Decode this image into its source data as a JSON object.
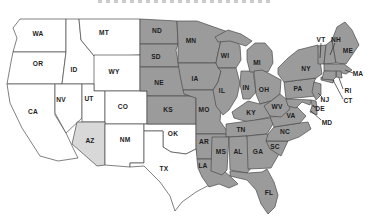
{
  "map": {
    "colors": {
      "shaded": "#9b9b9b",
      "highlight": "#d8d8d8",
      "unshaded": "#ffffff",
      "border": "#4a4a4a",
      "label": "#1d1d1d",
      "leader": "#2a2a2a"
    },
    "states": [
      {
        "abbr": "WA",
        "shade": "unshaded",
        "label_x": 38,
        "label_y": 34,
        "path": "M20,19 L66,19 L66,52 L13,52 L17,38 L13,28 Z"
      },
      {
        "abbr": "OR",
        "shade": "unshaded",
        "label_x": 38,
        "label_y": 64,
        "path": "M13,52 L66,52 L62,84 L7,84 L11,62 Z"
      },
      {
        "abbr": "CA",
        "shade": "unshaded",
        "label_x": 33,
        "label_y": 112,
        "path": "M7,84 L55,84 L55,115 L66,133 L74,150 L78,158 L58,161 L40,156 L22,128 L10,103 Z"
      },
      {
        "abbr": "ID",
        "shade": "unshaded",
        "label_x": 74,
        "label_y": 70,
        "path": "M66,19 L79,19 L81,40 L95,57 L95,84 L62,84 L66,52 Z"
      },
      {
        "abbr": "MT",
        "shade": "unshaded",
        "label_x": 104,
        "label_y": 33,
        "path": "M79,19 L140,19 L140,55 L95,57 L81,40 Z"
      },
      {
        "abbr": "WY",
        "shade": "unshaded",
        "label_x": 114,
        "label_y": 72,
        "path": "M94,55 L140,55 L140,91 L94,91 Z"
      },
      {
        "abbr": "NV",
        "shade": "unshaded",
        "label_x": 61,
        "label_y": 100,
        "path": "M55,84 L82,84 L82,118 L66,133 L55,113 Z"
      },
      {
        "abbr": "UT",
        "shade": "unshaded",
        "label_x": 89,
        "label_y": 99,
        "path": "M82,84 L94,84 L94,91 L105,91 L105,122 L82,122 Z"
      },
      {
        "abbr": "CO",
        "shade": "unshaded",
        "label_x": 123,
        "label_y": 107,
        "path": "M105,91 L147,91 L147,124 L105,124 Z"
      },
      {
        "abbr": "AZ",
        "shade": "highlight",
        "label_x": 90,
        "label_y": 141,
        "path": "M77,122 L105,122 L105,165 L97,166 L72,144 Z"
      },
      {
        "abbr": "NM",
        "shade": "unshaded",
        "label_x": 125,
        "label_y": 140,
        "path": "M105,124 L144,124 L144,163 L130,163 L130,167 L105,165 Z"
      },
      {
        "abbr": "OK",
        "shade": "unshaded",
        "label_x": 173,
        "label_y": 134,
        "path": "M144,124 L196,124 L196,149 L186,154 L171,152 L163,147 L163,131 L144,131 Z"
      },
      {
        "abbr": "TX",
        "shade": "unshaded",
        "label_x": 164,
        "label_y": 169,
        "path": "M144,131 L163,131 L163,147 L171,152 L186,154 L196,149 L199,161 L204,177 L211,184 L196,192 L182,202 L175,211 L170,196 L160,182 L148,170 L144,166 L130,167 L130,163 L144,163 Z"
      },
      {
        "abbr": "ND",
        "shade": "shaded",
        "label_x": 157,
        "label_y": 31,
        "path": "M140,19 L177,21 L178,44 L140,44 Z"
      },
      {
        "abbr": "SD",
        "shade": "shaded",
        "label_x": 156,
        "label_y": 57,
        "path": "M140,44 L178,44 L176,50 L179,67 L140,67 Z"
      },
      {
        "abbr": "NE",
        "shade": "shaded",
        "label_x": 159,
        "label_y": 83,
        "path": "M140,67 L179,67 L187,75 L196,89 L196,96 L147,96 L147,91 L140,91 Z"
      },
      {
        "abbr": "KS",
        "shade": "shaded",
        "label_x": 168,
        "label_y": 110,
        "path": "M147,96 L196,96 L196,124 L147,124 Z"
      },
      {
        "abbr": "MN",
        "shade": "shaded",
        "label_x": 191,
        "label_y": 41,
        "path": "M177,21 L197,21 L231,33 L221,40 L218,53 L216,63 L178,63 L178,44 Z"
      },
      {
        "abbr": "IA",
        "shade": "shaded",
        "label_x": 195,
        "label_y": 79,
        "path": "M178,63 L216,63 L221,71 L218,82 L213,90 L183,90 L180,75 Z"
      },
      {
        "abbr": "MO",
        "shade": "shaded",
        "label_x": 204,
        "label_y": 110,
        "path": "M183,90 L213,90 L222,101 L220,121 L229,134 L196,134 L196,98 L184,94 Z"
      },
      {
        "abbr": "AR",
        "shade": "shaded",
        "label_x": 204,
        "label_y": 142,
        "path": "M196,134 L229,134 L225,159 L197,159 L196,146 Z"
      },
      {
        "abbr": "LA",
        "shade": "shaded",
        "label_x": 203,
        "label_y": 166,
        "path": "M197,159 L225,159 L223,170 L231,177 L238,184 L229,188 L219,184 L209,187 L202,177 L198,168 Z"
      },
      {
        "abbr": "WI",
        "shade": "shaded",
        "label_x": 225,
        "label_y": 56,
        "path": "M221,40 L233,36 L240,46 L241,60 L236,68 L218,68 L216,63 L218,53 Z"
      },
      {
        "abbr": "IL",
        "shade": "shaded",
        "label_x": 222,
        "label_y": 91,
        "path": "M218,68 L236,68 L240,83 L237,97 L229,110 L223,115 L216,106 L213,90 L218,82 L221,71 Z"
      },
      {
        "abbr": "IN",
        "shade": "shaded",
        "label_x": 246,
        "label_y": 88,
        "path": "M241,71 L253,71 L256,92 L250,99 L243,99 L240,84 Z"
      },
      {
        "abbr": "MI",
        "shade": "shaded",
        "label_x": 257,
        "label_y": 63,
        "path": "M247,50 L255,43 L265,43 L272,51 L273,63 L268,72 L250,72 L247,60 Z M215,37 L228,30 L241,34 L252,41 L246,46 L230,41 L218,42 Z"
      },
      {
        "abbr": "OH",
        "shade": "shaded",
        "label_x": 264,
        "label_y": 90,
        "path": "M254,71 L262,70 L270,74 L281,80 L280,94 L271,101 L260,104 L256,94 Z"
      },
      {
        "abbr": "KY",
        "shade": "shaded",
        "label_x": 251,
        "label_y": 113,
        "path": "M232,112 L248,101 L260,104 L271,101 L278,106 L270,117 L248,122 L234,118 Z"
      },
      {
        "abbr": "TN",
        "shade": "shaded",
        "label_x": 241,
        "label_y": 130,
        "path": "M226,124 L270,118 L274,122 L267,134 L247,136 L226,137 Z"
      },
      {
        "abbr": "MS",
        "shade": "shaded",
        "label_x": 221,
        "label_y": 152,
        "path": "M212,137 L229,137 L227,170 L222,175 L211,171 Z"
      },
      {
        "abbr": "AL",
        "shade": "shaded",
        "label_x": 238,
        "label_y": 152,
        "path": "M229,137 L247,136 L252,167 L247,173 L230,170 Z"
      },
      {
        "abbr": "GA",
        "shade": "shaded",
        "label_x": 258,
        "label_y": 152,
        "path": "M247,136 L267,134 L272,143 L279,154 L271,168 L248,169 Z"
      },
      {
        "abbr": "FL",
        "shade": "shaded",
        "label_x": 269,
        "label_y": 193,
        "path": "M230,171 L248,173 L262,172 L267,169 L274,182 L278,195 L275,207 L268,214 L261,204 L256,190 L247,180 L230,176 Z"
      },
      {
        "abbr": "SC",
        "shade": "shaded",
        "label_x": 275,
        "label_y": 147,
        "path": "M266,141 L288,141 L281,156 L270,149 Z"
      },
      {
        "abbr": "NC",
        "shade": "shaded",
        "label_x": 285,
        "label_y": 132,
        "path": "M274,127 L300,123 L308,122 L311,129 L299,137 L288,141 L266,141 L268,134 Z"
      },
      {
        "abbr": "VA",
        "shade": "shaded",
        "label_x": 291,
        "label_y": 116,
        "path": "M270,117 L281,116 L290,105 L297,107 L306,116 L300,123 L274,127 Z"
      },
      {
        "abbr": "WV",
        "shade": "shaded",
        "label_x": 277,
        "label_y": 107,
        "path": "M264,106 L271,101 L280,94 L286,99 L292,102 L289,110 L281,117 L270,116 Z"
      },
      {
        "abbr": "PA",
        "shade": "shaded",
        "label_x": 298,
        "label_y": 89,
        "path": "M284,82 L316,78 L314,82 L316,96 L286,99 Z"
      },
      {
        "abbr": "NY",
        "shade": "shaded",
        "label_x": 306,
        "label_y": 69,
        "path": "M278,68 L288,58 L298,50 L318,45 L320,60 L322,74 L316,78 L284,82 L278,74 Z M321,77 L334,80 L333,83 L321,80 Z"
      },
      {
        "abbr": "NJ",
        "shade": "shaded",
        "label_x": 325,
        "label_y": 100,
        "leader": {
          "x1": 322,
          "y1": 97,
          "x2": 318,
          "y2": 93
        },
        "path": "M314,82 L321,84 L321,95 L316,100 L312,92 Z"
      },
      {
        "abbr": "DE",
        "shade": "shaded",
        "label_x": 320,
        "label_y": 109,
        "leader": {
          "x1": 315,
          "y1": 108,
          "x2": 313,
          "y2": 105
        },
        "path": "M311,100 L316,101 L317,107 L312,106 Z"
      },
      {
        "abbr": "MD",
        "shade": "shaded",
        "label_x": 327,
        "label_y": 123,
        "leader": {
          "x1": 321,
          "y1": 120,
          "x2": 311,
          "y2": 111
        },
        "path": "M286,99 L311,100 L310,105 L302,102 L296,108 L288,106 Z M312,106 L317,107 L317,115 L310,112 Z"
      },
      {
        "abbr": "VT",
        "shade": "shaded",
        "label_x": 321,
        "label_y": 40,
        "leader": {
          "x1": 321,
          "y1": 43,
          "x2": 320,
          "y2": 58
        },
        "path": "M318,46 L326,45 L324,64 L318,64 Z"
      },
      {
        "abbr": "NH",
        "shade": "shaded",
        "label_x": 336,
        "label_y": 40,
        "leader": {
          "x1": 335,
          "y1": 43,
          "x2": 330,
          "y2": 55
        },
        "path": "M326,45 L332,40 L336,63 L324,64 Z"
      },
      {
        "abbr": "ME",
        "shade": "shaded",
        "label_x": 348,
        "label_y": 51,
        "path": "M332,40 L337,27 L345,22 L352,30 L359,45 L346,64 L336,63 Z"
      },
      {
        "abbr": "MA",
        "shade": "shaded",
        "label_x": 358,
        "label_y": 74,
        "leader": {
          "x1": 353,
          "y1": 73,
          "x2": 345,
          "y2": 70
        },
        "path": "M324,64 L344,64 L352,70 L346,74 L338,72 L324,71 Z"
      },
      {
        "abbr": "RI",
        "shade": "shaded",
        "label_x": 348,
        "label_y": 91,
        "leader": {
          "x1": 343,
          "y1": 89,
          "x2": 339,
          "y2": 78
        },
        "path": "M336,71 L341,71 L342,78 L336,77 Z"
      },
      {
        "abbr": "CT",
        "shade": "shaded",
        "label_x": 348,
        "label_y": 101,
        "leader": {
          "x1": 343,
          "y1": 99,
          "x2": 333,
          "y2": 80
        },
        "path": "M324,71 L336,71 L336,77 L333,80 L322,79 Z"
      }
    ]
  }
}
